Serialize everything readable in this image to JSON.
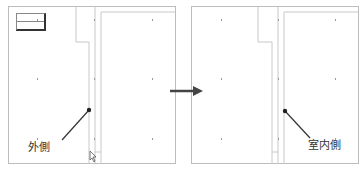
{
  "figure": {
    "left_panel": {
      "callout_label": "外側"
    },
    "right_panel": {
      "callout_label": "室内側"
    },
    "transition_arrow": "right-arrow",
    "colors": {
      "frame": "#bdbdbd",
      "wall_lines": "#c8c8c8",
      "callout": "#333333",
      "arrow": "#444444"
    }
  }
}
